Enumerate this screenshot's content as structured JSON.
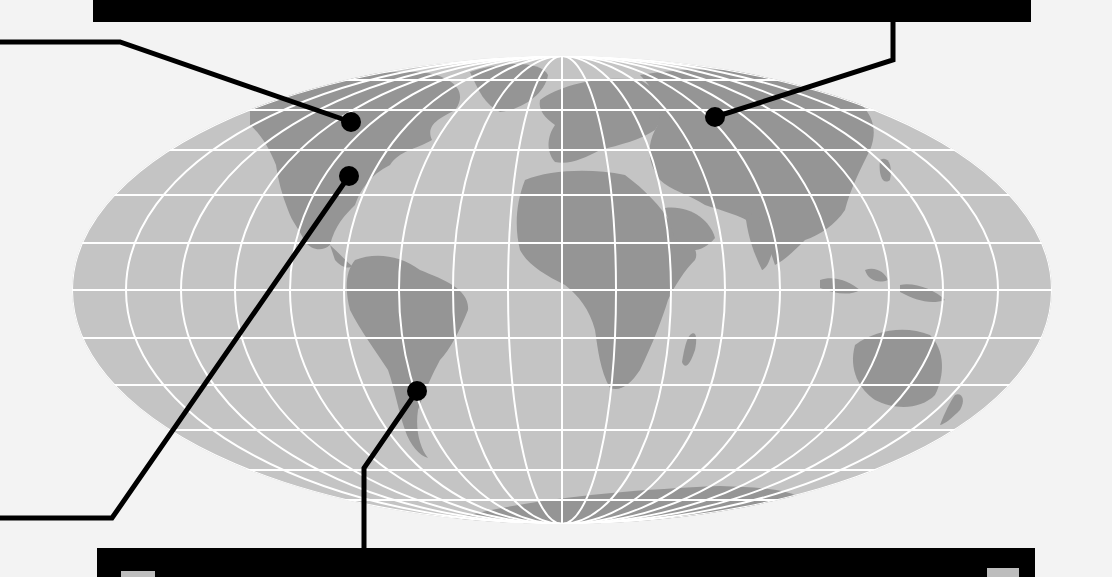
{
  "map": {
    "projection": "mollweide",
    "colors": {
      "background": "#f3f3f3",
      "ocean": "#c4c4c4",
      "land": "#959595",
      "graticule": "#ffffff",
      "callout": "#000000",
      "banner": "#000000",
      "banner_tab": "#bdbdbd"
    },
    "ellipse": {
      "cx": 562,
      "cy": 290,
      "rx": 490,
      "ry": 234
    },
    "graticule": {
      "parallels": 11,
      "meridians": 19
    }
  },
  "banners": {
    "top": {
      "label": ""
    },
    "bottom": {
      "label": ""
    }
  },
  "callouts": [
    {
      "id": "north-america-north",
      "pin": [
        351,
        122
      ],
      "path": [
        [
          0,
          42
        ],
        [
          120,
          42
        ],
        [
          351,
          122
        ]
      ]
    },
    {
      "id": "north-america-east",
      "pin": [
        349,
        176
      ],
      "path": [
        [
          0,
          518
        ],
        [
          112,
          518
        ],
        [
          349,
          176
        ]
      ]
    },
    {
      "id": "south-america-south",
      "pin": [
        417,
        391
      ],
      "path": [
        [
          364,
          548
        ],
        [
          364,
          468
        ],
        [
          417,
          391
        ]
      ]
    },
    {
      "id": "russia",
      "pin": [
        715,
        117
      ],
      "path": [
        [
          893,
          22
        ],
        [
          893,
          60
        ],
        [
          715,
          117
        ]
      ]
    }
  ]
}
